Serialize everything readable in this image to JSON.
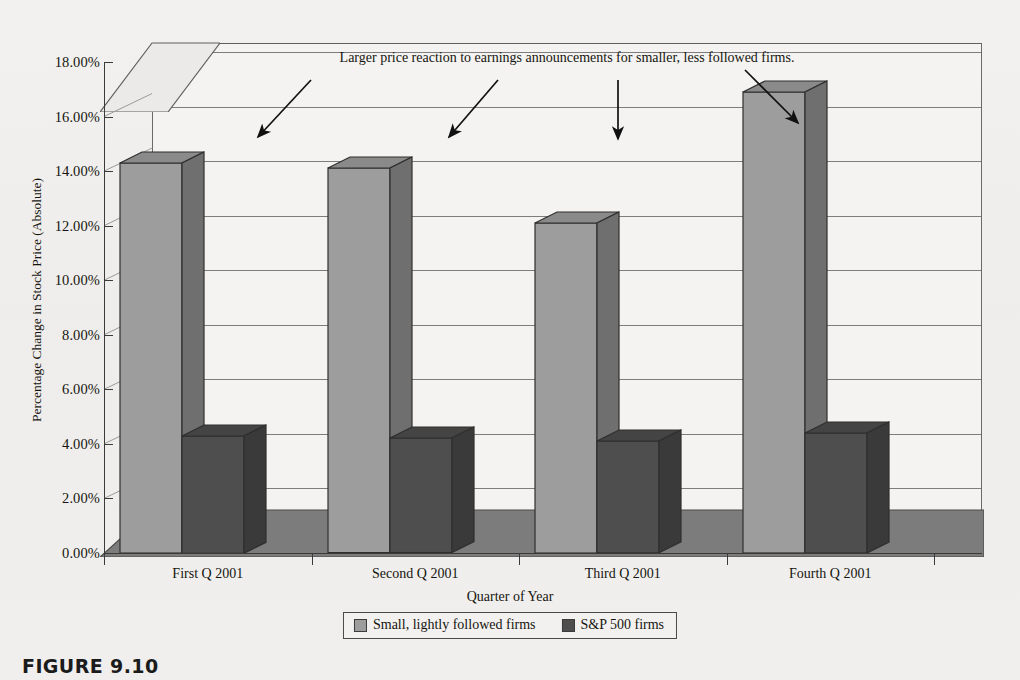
{
  "figure": {
    "caption": "FIGURE 9.10"
  },
  "chart_data": {
    "type": "bar",
    "title": "",
    "annotation": "Larger price reaction to earnings announcements for smaller, less followed firms.",
    "xlabel": "Quarter of Year",
    "ylabel": "Percentage Change in Stock Price (Absolute)",
    "categories": [
      "First Q  2001",
      "Second Q 2001",
      "Third Q 2001",
      "Fourth Q 2001"
    ],
    "series": [
      {
        "name": "Small, lightly followed firms",
        "color": "#9d9d9d",
        "values": [
          14.3,
          14.1,
          12.1,
          16.9
        ]
      },
      {
        "name": "S&P 500 firms",
        "color": "#4e4e4e",
        "values": [
          4.3,
          4.2,
          4.1,
          4.4
        ]
      }
    ],
    "ylim": [
      0,
      18
    ],
    "ytick_labels": [
      "0.00%",
      "2.00%",
      "4.00%",
      "6.00%",
      "8.00%",
      "10.00%",
      "12.00%",
      "14.00%",
      "16.00%",
      "18.00%"
    ],
    "ytick_values": [
      0,
      2,
      4,
      6,
      8,
      10,
      12,
      14,
      16,
      18
    ],
    "value_suffix": "%",
    "grid": true,
    "legend_position": "bottom",
    "three_d": true
  }
}
